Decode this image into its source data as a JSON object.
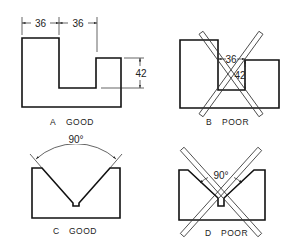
{
  "figures": [
    {
      "id": "A",
      "caption_letter": "A",
      "caption_word": "GOOD",
      "dimensions": {
        "width_left": "36",
        "width_notch": "36",
        "height_step": "42"
      }
    },
    {
      "id": "B",
      "caption_letter": "B",
      "caption_word": "POOR",
      "dimensions": {
        "width_notch": "36",
        "height_step": "42"
      }
    },
    {
      "id": "C",
      "caption_letter": "C",
      "caption_word": "GOOD",
      "dimensions": {
        "angle": "90°"
      }
    },
    {
      "id": "D",
      "caption_letter": "D",
      "caption_word": "POOR",
      "dimensions": {
        "angle": "90°"
      }
    }
  ],
  "colors": {
    "line": "#111111",
    "background": "#ffffff"
  }
}
